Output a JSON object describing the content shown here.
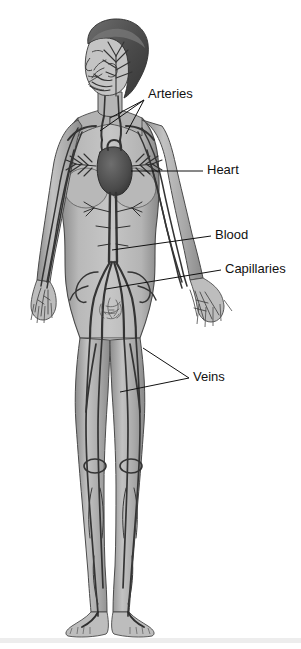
{
  "figure": {
    "style": "grayscale medical illustration",
    "width": 301,
    "height": 649
  },
  "colors": {
    "background": "#ffffff",
    "skin_light": "#c9c9c9",
    "skin_mid": "#a9a9a9",
    "skin_shadow": "#8f8f8f",
    "outline": "#4a4a4a",
    "vessel_dark": "#343434",
    "vessel_mid": "#5a5a5a",
    "hair": "#5e5e5e",
    "hair_dark": "#3c3c3c",
    "heart": "#4e4e4e",
    "label_text": "#111111",
    "leader_line": "#111111",
    "footer_band": "#ededed"
  },
  "labels": [
    {
      "id": "arteries",
      "text": "Arteries",
      "x": 148,
      "y": 95,
      "leaders": [
        {
          "path": "M 144 100 L 110 118"
        },
        {
          "path": "M 144 100 L 100 131"
        },
        {
          "path": "M 144 100 L 126 134"
        }
      ]
    },
    {
      "id": "heart",
      "text": "Heart",
      "x": 207,
      "y": 171,
      "leaders": [
        {
          "path": "M 203 171 L 131 171"
        }
      ]
    },
    {
      "id": "blood",
      "text": "Blood",
      "x": 215,
      "y": 236,
      "leaders": [
        {
          "path": "M 211 236 L 112 250"
        }
      ]
    },
    {
      "id": "capillaries",
      "text": "Capillaries",
      "x": 225,
      "y": 270,
      "leaders": [
        {
          "path": "M 221 270 L 106 289"
        }
      ]
    },
    {
      "id": "veins",
      "text": "Veins",
      "x": 193,
      "y": 378,
      "leaders": [
        {
          "path": "M 189 378 L 143 348"
        },
        {
          "path": "M 189 378 L 120 392"
        }
      ]
    }
  ],
  "anatomy_parts": [
    {
      "id": "head",
      "name": "Head with cranial and facial vessels"
    },
    {
      "id": "neck",
      "name": "Neck with carotid arteries and jugular veins"
    },
    {
      "id": "chest",
      "name": "Chest with heart and pulmonary vessels"
    },
    {
      "id": "arms",
      "name": "Arms with brachial vessels and hand capillaries"
    },
    {
      "id": "abdomen",
      "name": "Abdomen with aorta and vena cava"
    },
    {
      "id": "pelvis",
      "name": "Pelvis with iliac bifurcation and capillary bed"
    },
    {
      "id": "legs",
      "name": "Legs with femoral vessels and knee loops"
    },
    {
      "id": "feet",
      "name": "Feet with pedal vessels"
    }
  ]
}
